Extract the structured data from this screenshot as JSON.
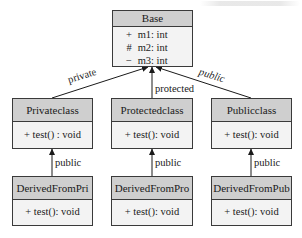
{
  "diagram": {
    "type": "uml-class-inheritance",
    "colors": {
      "header_fill": "#cfcfcf",
      "body_fill": "#f3f3f3",
      "border": "#3a3a3a",
      "line": "#1a1a1a"
    },
    "base": {
      "name": "Base",
      "members": [
        {
          "visibility": "+",
          "text": "m1: int"
        },
        {
          "visibility": "#",
          "text": "m2: int"
        },
        {
          "visibility": "−",
          "text": "m3: int"
        }
      ]
    },
    "middle": [
      {
        "name": "Privateclass",
        "method": "+ test() : void",
        "inherit_label": "private"
      },
      {
        "name": "Protectedclass",
        "method": "+ test(): void",
        "inherit_label": "protected"
      },
      {
        "name": "Publicclass",
        "method": "+ test():  void",
        "inherit_label": "public"
      }
    ],
    "derived": [
      {
        "name": "DerivedFromPri",
        "method": "+ test():  void",
        "inherit_label": "public"
      },
      {
        "name": "DerivedFromPro",
        "method": "+ test():  void",
        "inherit_label": "public"
      },
      {
        "name": "DerivedFromPub",
        "method": "+ test():  void",
        "inherit_label": "public"
      }
    ]
  }
}
